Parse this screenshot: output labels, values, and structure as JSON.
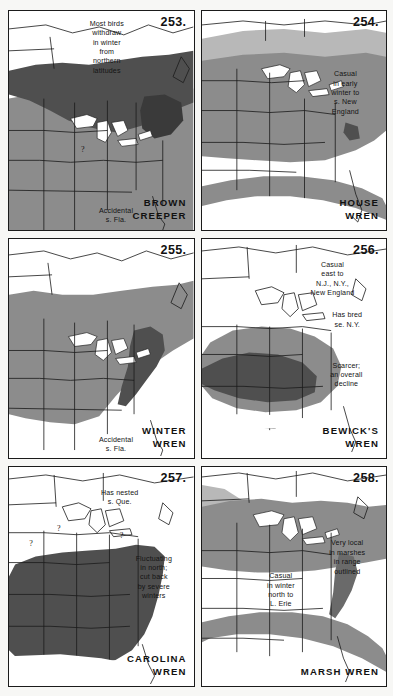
{
  "page": {
    "background_color": "#f7f7f5",
    "ink_color": "#1b1b1b",
    "shade_dark": "#4f4f4f",
    "shade_medium": "#8c8c8c",
    "shade_light": "#b8b8b8",
    "water_color": "#ffffff"
  },
  "panels": [
    {
      "number": "253.",
      "species": "BROWN\nCREEPER",
      "notes": [
        "Most birds\nwithdraw\nin winter\nfrom\nnorthern\nlatitudes",
        "Accidental\ns. Fla."
      ],
      "question_marks": 1,
      "shades_used": [
        "dark",
        "medium"
      ]
    },
    {
      "number": "254.",
      "species": "HOUSE\nWREN",
      "notes": [
        "Casual\nin early\nwinter to\ns. New\nEngland"
      ],
      "question_marks": 0,
      "shades_used": [
        "medium",
        "light"
      ]
    },
    {
      "number": "255.",
      "species": "WINTER\nWREN",
      "notes": [
        "Accidental\ns. Fla."
      ],
      "question_marks": 0,
      "shades_used": [
        "dark",
        "medium"
      ]
    },
    {
      "number": "256.",
      "species": "BEWICK'S\nWREN",
      "notes": [
        "Casual\neast to\nN.J., N.Y.,\nNew England",
        "Has bred\nse. N.Y.",
        "Scarcer;\nan overall\ndecline"
      ],
      "question_marks": 0,
      "shades_used": [
        "dark",
        "medium"
      ]
    },
    {
      "number": "257.",
      "species": "CAROLINA\nWREN",
      "notes": [
        "Has nested\ns. Que.",
        "Fluctuating\nin north;\ncut back\nby severe\nwinters"
      ],
      "question_marks": 3,
      "shades_used": [
        "dark"
      ]
    },
    {
      "number": "258.",
      "species": "MARSH WREN",
      "notes": [
        "Very local\nin marshes\nin range\noutlined",
        "Casual\nin winter\nnorth to\nL. Erie"
      ],
      "question_marks": 0,
      "shades_used": [
        "medium",
        "light"
      ]
    }
  ]
}
